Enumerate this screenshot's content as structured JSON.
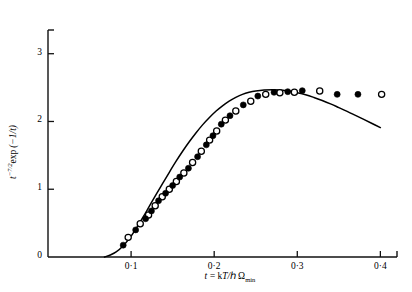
{
  "chart_data": {
    "type": "scatter",
    "title": "",
    "subtitle": "",
    "xlabel": "t = kT/ħΩmin",
    "ylabel": "t^(-7/2) exp(-1/t)",
    "xlim": [
      0.0,
      0.42
    ],
    "ylim": [
      0.0,
      3.35
    ],
    "grid": false,
    "legend_position": "none",
    "xticks": [
      0.1,
      0.2,
      0.3,
      0.4
    ],
    "xtick_labels": [
      "0·1",
      "0·2",
      "0·3",
      "0·4"
    ],
    "yticks": [
      0,
      1,
      2,
      3
    ],
    "ytick_labels": [
      "0",
      "1",
      "2",
      "3"
    ],
    "series": [
      {
        "name": "filled-circles",
        "marker": "filled-circle",
        "color": "#000000",
        "x": [
          0.0905,
          0.1055,
          0.1175,
          0.1245,
          0.133,
          0.1415,
          0.15,
          0.1585,
          0.169,
          0.18,
          0.1905,
          0.1985,
          0.2085,
          0.219,
          0.235,
          0.2525,
          0.272,
          0.2885,
          0.306,
          0.348,
          0.373
        ],
        "y": [
          0.175,
          0.4,
          0.565,
          0.68,
          0.83,
          0.94,
          1.055,
          1.18,
          1.31,
          1.48,
          1.655,
          1.79,
          1.96,
          2.085,
          2.245,
          2.375,
          2.43,
          2.44,
          2.455,
          2.4,
          2.4
        ]
      },
      {
        "name": "open-circles",
        "marker": "open-circle",
        "color": "#000000",
        "x": [
          0.0965,
          0.111,
          0.121,
          0.129,
          0.1375,
          0.146,
          0.1545,
          0.1635,
          0.174,
          0.1845,
          0.1945,
          0.203,
          0.2135,
          0.226,
          0.244,
          0.262,
          0.279,
          0.2965,
          0.327,
          0.4015
        ],
        "y": [
          0.29,
          0.49,
          0.62,
          0.755,
          0.89,
          1.0,
          1.115,
          1.24,
          1.395,
          1.56,
          1.725,
          1.86,
          2.02,
          2.155,
          2.3,
          2.4,
          2.425,
          2.43,
          2.45,
          2.4
        ]
      },
      {
        "name": "theory-curve",
        "marker": "line",
        "color": "#000000",
        "x": [
          0.068,
          0.075,
          0.082,
          0.09,
          0.098,
          0.106,
          0.114,
          0.122,
          0.13,
          0.138,
          0.146,
          0.154,
          0.162,
          0.17,
          0.178,
          0.186,
          0.194,
          0.202,
          0.21,
          0.218,
          0.226,
          0.234,
          0.242,
          0.25,
          0.26,
          0.27,
          0.28,
          0.29,
          0.3,
          0.31,
          0.32,
          0.33,
          0.34,
          0.35,
          0.36,
          0.37,
          0.38,
          0.39,
          0.4
        ],
        "y": [
          0.0,
          0.03,
          0.075,
          0.16,
          0.275,
          0.42,
          0.58,
          0.75,
          0.92,
          1.085,
          1.25,
          1.41,
          1.56,
          1.7,
          1.83,
          1.95,
          2.055,
          2.15,
          2.23,
          2.3,
          2.355,
          2.4,
          2.43,
          2.45,
          2.465,
          2.47,
          2.465,
          2.45,
          2.425,
          2.395,
          2.355,
          2.31,
          2.26,
          2.205,
          2.15,
          2.09,
          2.03,
          1.97,
          1.91
        ]
      }
    ]
  },
  "axes": {
    "x_axis_name": "x-axis",
    "y_axis_name": "y-axis"
  }
}
